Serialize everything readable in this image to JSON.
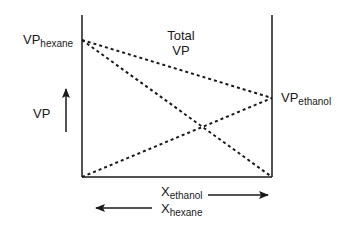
{
  "diagram": {
    "title_line1": "Total",
    "title_line2": "VP",
    "y_axis_label": "VP",
    "left_point": {
      "main": "VP",
      "sub": "hexane"
    },
    "right_point": {
      "main": "VP",
      "sub": "ethanol"
    },
    "x_label_ethanol": {
      "main": "X",
      "sub": "ethanol",
      "direction": "right"
    },
    "x_label_hexane": {
      "main": "X",
      "sub": "hexane",
      "direction": "left"
    },
    "colors": {
      "line": "#1a1a1a",
      "background": "#ffffff"
    },
    "lines": [
      {
        "name": "hexane-partial-vp",
        "from": "VP hexane (left, high)",
        "to": "0 (right, bottom)",
        "style": "dotted"
      },
      {
        "name": "ethanol-partial-vp",
        "from": "0 (left, bottom)",
        "to": "VP ethanol (right, middle)",
        "style": "dotted"
      },
      {
        "name": "total-vp",
        "from": "VP hexane (left)",
        "to": "VP ethanol (right)",
        "style": "dotted"
      }
    ]
  }
}
